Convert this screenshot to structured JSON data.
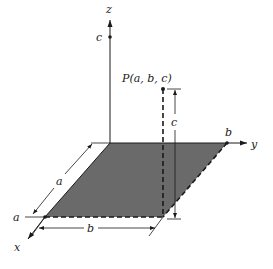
{
  "diagram": {
    "colors": {
      "ink": "#1a1a1a",
      "plane_fill": "#6a6a6a",
      "background": "#ffffff"
    },
    "axes": {
      "x_label": "x",
      "y_label": "y",
      "z_label": "z"
    },
    "axis_marks": {
      "z_mark": "c",
      "y_mark": "b",
      "x_mark": "a"
    },
    "point": {
      "label": "P(a, b, c)"
    },
    "dimensions": {
      "x_extent": "a",
      "y_extent": "b",
      "z_height": "c"
    }
  }
}
